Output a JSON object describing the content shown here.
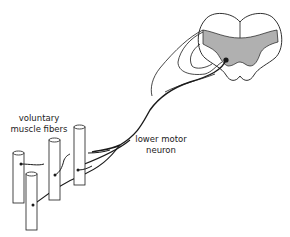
{
  "diagram": {
    "labels": {
      "muscle_line1": "voluntary",
      "muscle_line2": "muscle fibers",
      "neuron_line1": "lower motor",
      "neuron_line2": "neuron"
    },
    "colors": {
      "stroke": "#1a1a1a",
      "gray_matter": "#b0b0b0",
      "background": "#ffffff"
    }
  }
}
